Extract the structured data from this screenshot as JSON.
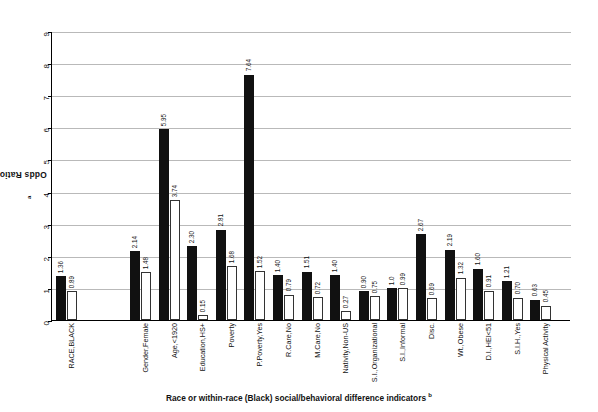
{
  "chart_data": {
    "type": "bar",
    "title": "",
    "ylabel": "Odds Ratios",
    "ylabel_footnote": "a",
    "xlabel": "Race or within-race (Black) social/behavioral difference indicators",
    "xlabel_footnote": "b",
    "ylim": [
      0,
      9
    ],
    "ytick_labels": [
      "0",
      "1",
      "2",
      "3",
      "4",
      "5",
      "6",
      "7",
      "8",
      "9"
    ],
    "grid": true,
    "legend": "none",
    "categories": [
      "RACE,BLACK",
      "Gender,Female",
      "Age,<1920",
      "Education,HS+",
      "Poverty",
      "P.Poverty,Yes",
      "R.Care,No",
      "M.Care,No",
      "Nativity,Non-US",
      "S.I.,Organizational",
      "S.I.,Informal",
      "Disc.",
      "Wt.,Obese",
      "D.I.,HEI<51",
      "S.I.H.,Yes",
      "Physical Activity"
    ],
    "series": [
      {
        "name": "black-bar",
        "color": "#111111",
        "values": [
          1.36,
          2.14,
          5.95,
          2.3,
          2.81,
          7.64,
          1.4,
          1.51,
          1.4,
          0.9,
          1.0,
          2.67,
          2.19,
          1.6,
          1.21,
          0.63
        ]
      },
      {
        "name": "white-bar",
        "color": "#ffffff",
        "values": [
          0.89,
          1.48,
          3.74,
          0.15,
          1.68,
          1.52,
          0.79,
          0.72,
          0.27,
          0.75,
          0.99,
          0.69,
          1.32,
          0.91,
          0.7,
          0.45
        ]
      }
    ]
  }
}
